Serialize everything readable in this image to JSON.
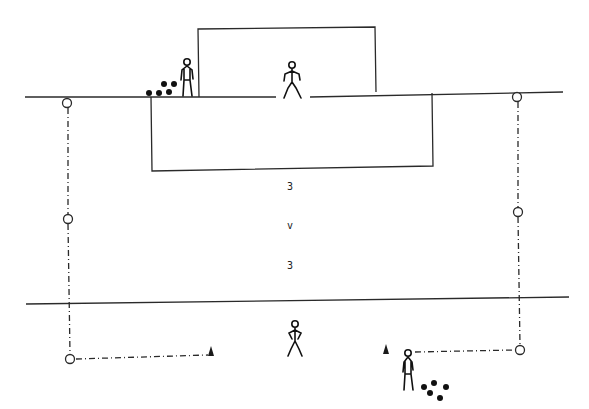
{
  "diagram": {
    "type": "football drill pitch diagram",
    "labels": {
      "team_a": "3",
      "versus": "v",
      "team_b": "3"
    },
    "elements": {
      "goal": "goal-frame",
      "penalty_area": "penalty-box",
      "goal_line": "top-line",
      "halfway_line": "bottom-line",
      "players": [
        "goalkeeper",
        "server-top-left",
        "defender-bottom",
        "server-bottom-right"
      ],
      "cones": 2,
      "marker_discs": 6,
      "ball_groups": 2
    },
    "colors": {
      "line": "#2a2a2a",
      "background": "#ffffff"
    }
  }
}
